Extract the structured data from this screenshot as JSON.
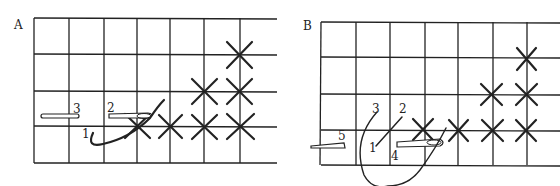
{
  "figure": {
    "panels": [
      {
        "label": "A",
        "grid": {
          "cols": 7,
          "rows": 4
        },
        "numbers": [
          "1",
          "2",
          "3"
        ],
        "stitches_per_row": [
          1,
          2,
          4
        ],
        "description": "Cross stitches worked in a staircase; needle inserted at 2 emerging at 3, thread from 1"
      },
      {
        "label": "B",
        "grid": {
          "cols": 7,
          "rows": 4
        },
        "numbers": [
          "1",
          "2",
          "3",
          "4",
          "5"
        ],
        "stitches_per_row": [
          1,
          2,
          4
        ],
        "description": "Half stitch 1-2, looping thread from 3 to 4, needle emerging at 5"
      }
    ],
    "ink_color": "#222222",
    "background": "#ffffff"
  }
}
